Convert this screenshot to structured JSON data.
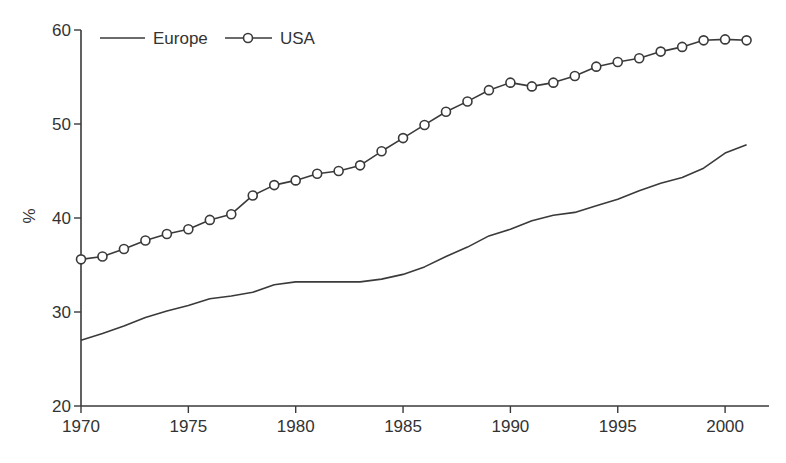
{
  "chart_data": {
    "type": "line",
    "title": "",
    "xlabel": "",
    "ylabel": "%",
    "xlim": [
      1970,
      2002
    ],
    "ylim": [
      20,
      60
    ],
    "grid": false,
    "legend_position": "top-left",
    "x_ticks": [
      "1970",
      "1975",
      "1980",
      "1985",
      "1990",
      "1995",
      "2000"
    ],
    "y_ticks": [
      "20",
      "30",
      "40",
      "50",
      "60"
    ],
    "x": [
      1970,
      1971,
      1972,
      1973,
      1974,
      1975,
      1976,
      1977,
      1978,
      1979,
      1980,
      1981,
      1982,
      1983,
      1984,
      1985,
      1986,
      1987,
      1988,
      1989,
      1990,
      1991,
      1992,
      1993,
      1994,
      1995,
      1996,
      1997,
      1998,
      1999,
      2000,
      2001
    ],
    "series": [
      {
        "name": "Europe",
        "marker": "none",
        "values": [
          27.0,
          27.7,
          28.5,
          29.4,
          30.1,
          30.7,
          31.4,
          31.7,
          32.1,
          32.9,
          33.2,
          33.2,
          33.2,
          33.2,
          33.5,
          34.0,
          34.8,
          35.9,
          36.9,
          38.1,
          38.8,
          39.7,
          40.3,
          40.6,
          41.3,
          42.0,
          42.9,
          43.7,
          44.3,
          45.3,
          46.9,
          47.8
        ]
      },
      {
        "name": "USA",
        "marker": "open-circle",
        "values": [
          35.6,
          35.9,
          36.7,
          37.6,
          38.3,
          38.8,
          39.8,
          40.4,
          42.4,
          43.5,
          44.0,
          44.7,
          45.0,
          45.6,
          47.1,
          48.5,
          49.9,
          51.3,
          52.4,
          53.6,
          54.4,
          54.0,
          54.4,
          55.1,
          56.1,
          56.6,
          57.0,
          57.7,
          58.2,
          58.9,
          59.0,
          58.9
        ]
      }
    ]
  },
  "colors": {
    "line": "#3a3a3a",
    "text": "#333333",
    "marker_fill": "#ffffff"
  }
}
